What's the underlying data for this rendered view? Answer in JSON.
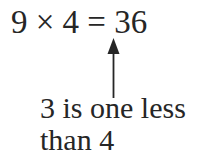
{
  "equation": {
    "text": "9 × 4 = 36"
  },
  "annotation": {
    "line1": "3 is one less",
    "line2": "than 4"
  },
  "arrow": {
    "direction": "up",
    "points_to": "3 in 36"
  }
}
